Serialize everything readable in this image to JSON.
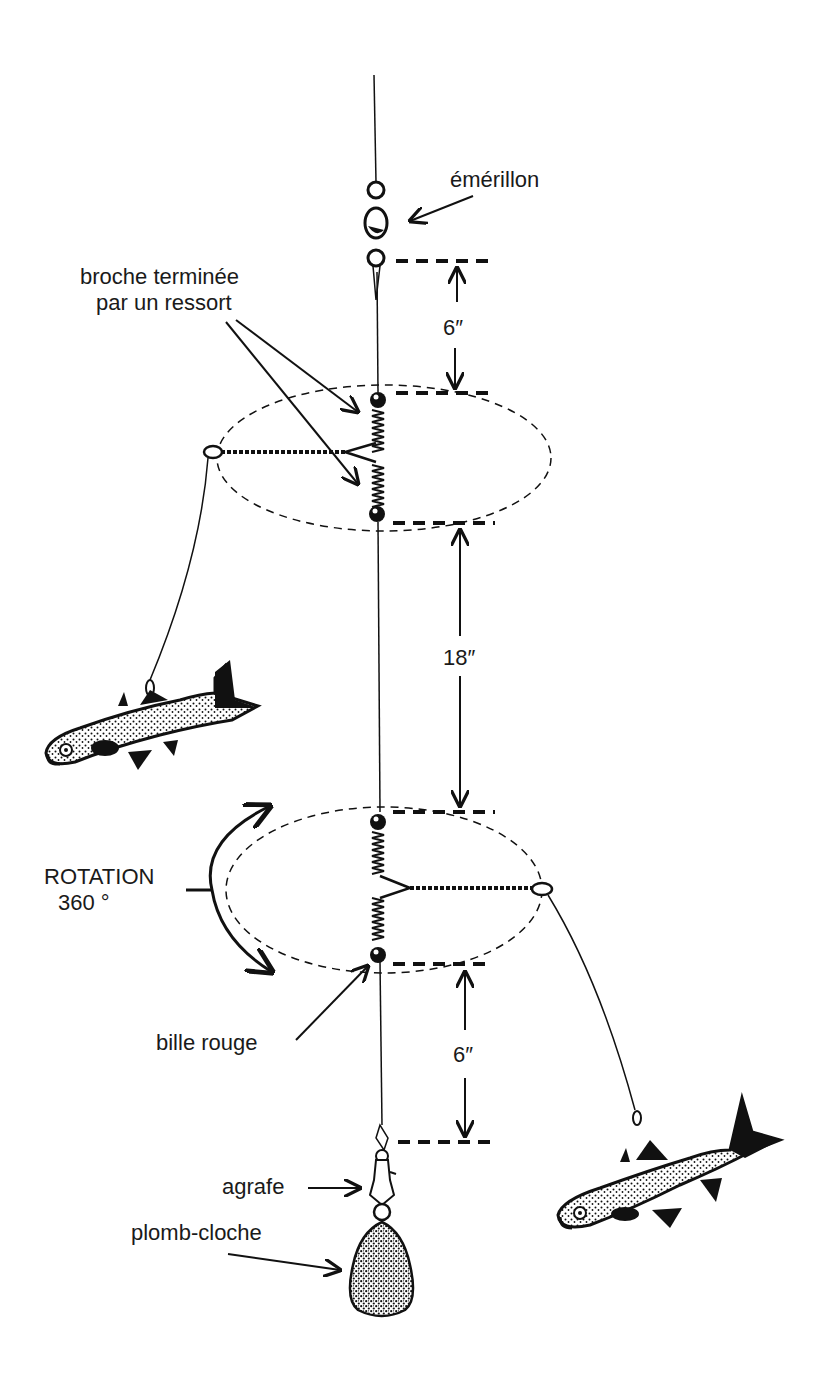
{
  "diagram": {
    "type": "fishing-rig",
    "colors": {
      "ink": "#111111",
      "background": "#ffffff",
      "label": "#1a1a1a"
    },
    "labels": {
      "swivel": "émérillon",
      "spring_wire_line1": "broche terminée",
      "spring_wire_line2": "par un ressort",
      "rotation_line1": "ROTATION",
      "rotation_line2": "360 °",
      "red_bead": "bille rouge",
      "snap": "agrafe",
      "bell_sinker": "plomb-cloche"
    },
    "dimensions": {
      "top_gap": "6″",
      "middle_gap": "18″",
      "bottom_gap": "6″"
    },
    "components": [
      {
        "id": "main-line",
        "label": "main line"
      },
      {
        "id": "swivel",
        "label": "émérillon"
      },
      {
        "id": "upper-spring-arm",
        "label": "broche terminée par un ressort"
      },
      {
        "id": "lower-spring-arm",
        "label": "broche terminée par un ressort"
      },
      {
        "id": "upper-bait-fish",
        "label": "bait fish (left)"
      },
      {
        "id": "lower-bait-fish",
        "label": "bait fish (right)"
      },
      {
        "id": "snap",
        "label": "agrafe"
      },
      {
        "id": "bell-sinker",
        "label": "plomb-cloche"
      }
    ]
  }
}
